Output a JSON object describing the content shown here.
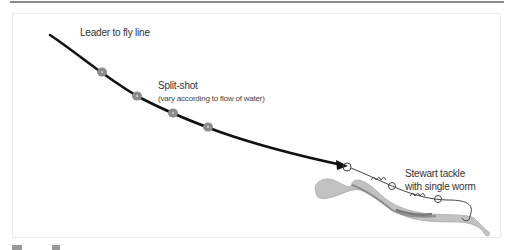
{
  "figure": {
    "labels": {
      "leader": "Leader to fly line",
      "split_shot": "Split-shot",
      "split_shot_note": "(vary according to flow of water)",
      "tackle_line1": "Stewart tackle",
      "tackle_line2": "with single worm"
    },
    "components": [
      "leader-line",
      "split-shot-1",
      "split-shot-2",
      "split-shot-3",
      "split-shot-4",
      "stewart-tackle",
      "worm"
    ],
    "colors": {
      "line": "#111111",
      "split_shot": "#8c8c8c",
      "worm": "#b5b5b5",
      "tackle": "#555555"
    }
  }
}
